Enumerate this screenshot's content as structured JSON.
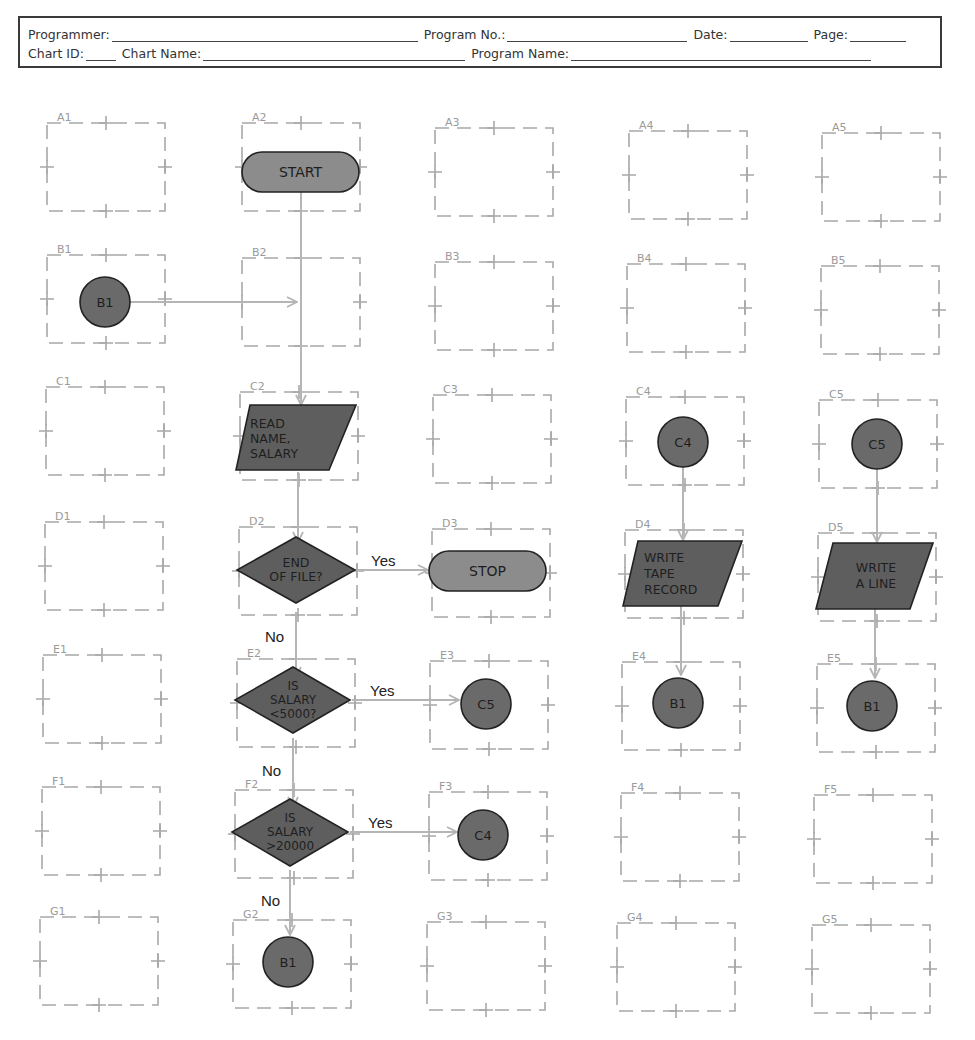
{
  "header": {
    "programmer_label": "Programmer:",
    "program_no_label": "Program No.:",
    "date_label": "Date:",
    "page_label": "Page:",
    "chart_id_label": "Chart ID:",
    "chart_name_label": "Chart Name:",
    "program_name_label": "Program Name:",
    "programmer_value": "",
    "program_no_value": "",
    "date_value": "",
    "page_value": "",
    "chart_id_value": "",
    "chart_name_value": "",
    "program_name_value": ""
  },
  "grid": {
    "rows": [
      "A",
      "B",
      "C",
      "D",
      "E",
      "F",
      "G"
    ],
    "columns": [
      "1",
      "2",
      "3",
      "4",
      "5"
    ],
    "cells": {
      "A1": "A1",
      "A2": "A2",
      "A3": "A3",
      "A4": "A4",
      "A5": "A5",
      "B1": "B1",
      "B2": "B2",
      "B3": "B3",
      "B4": "B4",
      "B5": "B5",
      "C1": "C1",
      "C2": "C2",
      "C3": "C3",
      "C4": "C4",
      "C5": "C5",
      "D1": "D1",
      "D2": "D2",
      "D3": "D3",
      "D4": "D4",
      "D5": "D5",
      "E1": "E1",
      "E2": "E2",
      "E3": "E3",
      "E4": "E4",
      "E5": "E5",
      "F1": "F1",
      "F2": "F2",
      "F3": "F3",
      "F4": "F4",
      "F5": "F5",
      "G1": "G1",
      "G2": "G2",
      "G3": "G3",
      "G4": "G4",
      "G5": "G5"
    }
  },
  "flowchart": {
    "colors": {
      "terminal_fill": "#8c8c8c",
      "process_fill": "#5e5e5e",
      "connector_fill": "#6a6a6a",
      "outline": "#222222",
      "flowline": "#b5b5b5",
      "grid_dash": "#a8a8a8"
    },
    "nodes": {
      "start": {
        "cell": "A2",
        "type": "terminal",
        "text": "START"
      },
      "b1_entry": {
        "cell": "B1",
        "type": "connector",
        "text": "B1"
      },
      "read": {
        "cell": "C2",
        "type": "input-output",
        "line1": "READ",
        "line2": "NAME,",
        "line3": "SALARY"
      },
      "eof": {
        "cell": "D2",
        "type": "decision",
        "line1": "END",
        "line2": "OF FILE?"
      },
      "stop": {
        "cell": "D3",
        "type": "terminal",
        "text": "STOP"
      },
      "lt5000": {
        "cell": "E2",
        "type": "decision",
        "line1": "IS",
        "line2": "SALARY",
        "line3": "<5000?"
      },
      "to_c5": {
        "cell": "E3",
        "type": "connector",
        "text": "C5"
      },
      "gt20000": {
        "cell": "F2",
        "type": "decision",
        "line1": "IS",
        "line2": "SALARY",
        "line3": ">20000"
      },
      "to_c4": {
        "cell": "F3",
        "type": "connector",
        "text": "C4"
      },
      "to_b1_g2": {
        "cell": "G2",
        "type": "connector",
        "text": "B1"
      },
      "c4_entry": {
        "cell": "C4",
        "type": "connector",
        "text": "C4"
      },
      "write_tape": {
        "cell": "D4",
        "type": "input-output",
        "line1": "WRITE",
        "line2": "TAPE",
        "line3": "RECORD"
      },
      "to_b1_e4": {
        "cell": "E4",
        "type": "connector",
        "text": "B1"
      },
      "c5_entry": {
        "cell": "C5",
        "type": "connector",
        "text": "C5"
      },
      "write_line": {
        "cell": "D5",
        "type": "input-output",
        "line1": "WRITE",
        "line2": "A LINE"
      },
      "to_b1_e5": {
        "cell": "E5",
        "type": "connector",
        "text": "B1"
      }
    },
    "branch_labels": {
      "eof_yes": "Yes",
      "eof_no": "No",
      "lt5000_yes": "Yes",
      "lt5000_no": "No",
      "gt20000_yes": "Yes",
      "gt20000_no": "No"
    }
  }
}
